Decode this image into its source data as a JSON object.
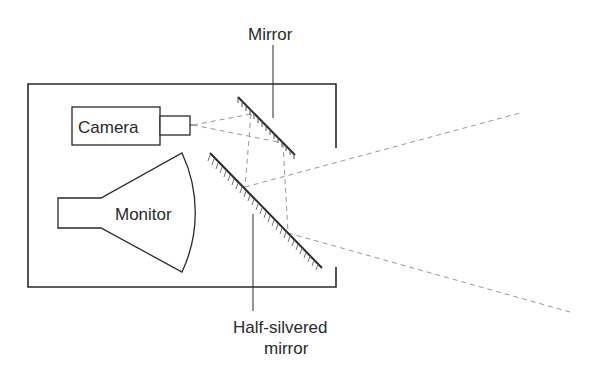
{
  "diagram": {
    "labels": {
      "mirror": "Mirror",
      "camera": "Camera",
      "monitor": "Monitor",
      "half_silvered_line1": "Half-silvered",
      "half_silvered_line2": "mirror"
    },
    "colors": {
      "line": "#2a2a2a",
      "dashed": "#9a9a9a",
      "background": "#ffffff"
    }
  }
}
